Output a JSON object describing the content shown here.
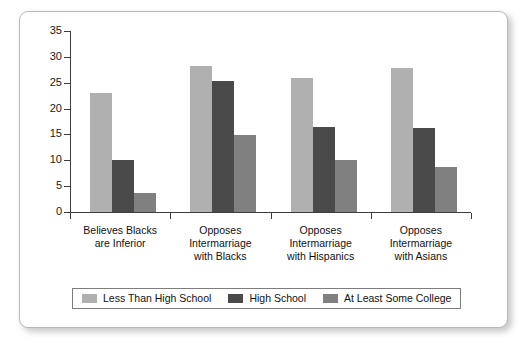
{
  "chart_data": {
    "type": "bar",
    "title": "",
    "xlabel": "",
    "ylabel": "",
    "ylim": [
      0,
      35
    ],
    "ytick_values": [
      0,
      5,
      10,
      15,
      20,
      25,
      30,
      35
    ],
    "ytick_labels": [
      "0",
      "5",
      "10",
      "15",
      "20",
      "25",
      "30",
      "35"
    ],
    "grid": false,
    "legend_position": "bottom",
    "categories": [
      "Believes Blacks are Inferior",
      "Opposes Intermarriage with Blacks",
      "Opposes Intermarriage with Hispanics",
      "Opposes Intermarriage with Asians"
    ],
    "category_lines": [
      [
        "Believes Blacks",
        "are Inferior"
      ],
      [
        "Opposes",
        "Intermarriage",
        "with Blacks"
      ],
      [
        "Opposes",
        "Intermarriage",
        "with Hispanics"
      ],
      [
        "Opposes",
        "Intermarriage",
        "with Asians"
      ]
    ],
    "series": [
      {
        "name": "Less Than High School",
        "color": "#b0b0b0",
        "values": [
          23.0,
          28.3,
          25.9,
          27.8
        ]
      },
      {
        "name": "High School",
        "color": "#4a4a4a",
        "values": [
          10.0,
          25.3,
          16.4,
          16.3
        ]
      },
      {
        "name": "At Least Some College",
        "color": "#808080",
        "values": [
          3.7,
          14.9,
          10.0,
          8.7
        ]
      }
    ]
  },
  "legend": {
    "entries": [
      {
        "label": "Less Than High School",
        "color": "#b0b0b0"
      },
      {
        "label": "High School",
        "color": "#4a4a4a"
      },
      {
        "label": "At Least Some College",
        "color": "#808080"
      }
    ]
  }
}
